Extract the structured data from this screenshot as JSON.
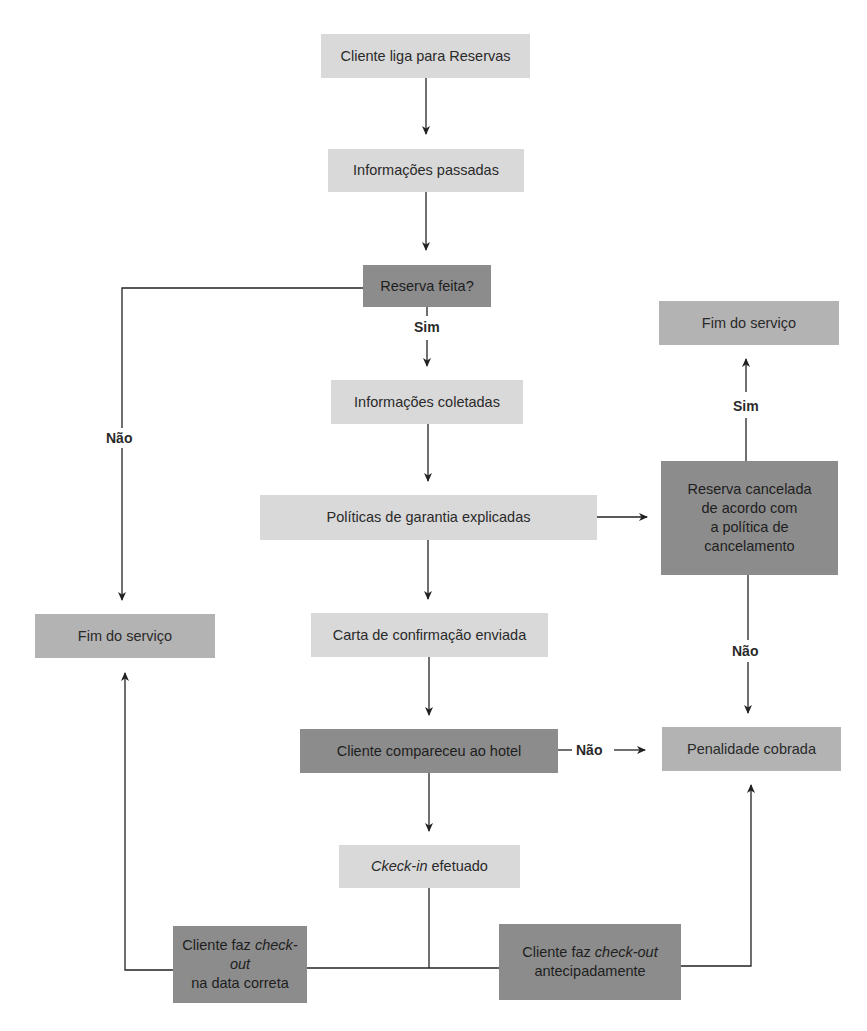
{
  "diagram": {
    "type": "flowchart",
    "language": "pt-BR",
    "colors": {
      "light_box": "#d9d9d9",
      "mid_box": "#b3b3b3",
      "dark_box": "#8c8c8c",
      "edge": "#222222"
    },
    "nodes": {
      "cliente_liga": {
        "text": "Cliente liga para Reservas"
      },
      "info_passadas": {
        "text": "Informações passadas"
      },
      "reserva_feita": {
        "text": "Reserva feita?"
      },
      "info_coletadas": {
        "text": "Informações coletadas"
      },
      "politicas": {
        "text": "Políticas de garantia explicadas"
      },
      "carta": {
        "text": "Carta de confirmação enviada"
      },
      "compareceu": {
        "text": "Cliente compareceu ao hotel"
      },
      "checkin": {
        "italic": "Ckeck-in",
        "rest": " efetuado"
      },
      "checkout_correta": {
        "line1_plain": "Cliente faz ",
        "line1_italic": "check-out",
        "line2": "na data correta"
      },
      "checkout_antecipado": {
        "line1_plain": "Cliente faz ",
        "line1_italic": "check-out",
        "line2": "antecipadamente"
      },
      "fim_left": {
        "text": "Fim do serviço"
      },
      "fim_right": {
        "text": "Fim do serviço"
      },
      "cancelada": {
        "lines": [
          "Reserva cancelada",
          "de acordo com",
          "a política de",
          "cancelamento"
        ]
      },
      "penalidade": {
        "text": "Penalidade cobrada"
      }
    },
    "edge_labels": {
      "sim_reserva": "Sim",
      "nao_reserva": "Não",
      "sim_cancelada": "Sim",
      "nao_cancelada": "Não",
      "nao_compareceu": "Não"
    },
    "edges": [
      {
        "from": "cliente_liga",
        "to": "info_passadas"
      },
      {
        "from": "info_passadas",
        "to": "reserva_feita"
      },
      {
        "from": "reserva_feita",
        "to": "info_coletadas",
        "label": "Sim"
      },
      {
        "from": "reserva_feita",
        "to": "fim_left",
        "label": "Não"
      },
      {
        "from": "info_coletadas",
        "to": "politicas"
      },
      {
        "from": "politicas",
        "to": "carta"
      },
      {
        "from": "politicas",
        "to": "cancelada"
      },
      {
        "from": "cancelada",
        "to": "fim_right",
        "label": "Sim"
      },
      {
        "from": "cancelada",
        "to": "penalidade",
        "label": "Não"
      },
      {
        "from": "carta",
        "to": "compareceu"
      },
      {
        "from": "compareceu",
        "to": "penalidade",
        "label": "Não"
      },
      {
        "from": "compareceu",
        "to": "checkin"
      },
      {
        "from": "checkin",
        "to": "checkout_correta"
      },
      {
        "from": "checkin",
        "to": "checkout_antecipado"
      },
      {
        "from": "checkout_correta",
        "to": "fim_left"
      },
      {
        "from": "checkout_antecipado",
        "to": "penalidade"
      }
    ]
  }
}
